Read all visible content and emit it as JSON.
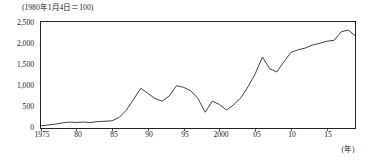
{
  "chart_data": {
    "type": "line",
    "title": "(1980年1月4日＝100)",
    "xlabel": "(年)",
    "ylabel": "",
    "xlim": [
      1975,
      2019
    ],
    "ylim": [
      0,
      2500
    ],
    "grid": false,
    "legend": "none",
    "y_ticks": [
      "0",
      "500",
      "1,000",
      "1,500",
      "2,000",
      "2,500"
    ],
    "y_tick_values": [
      0,
      500,
      1000,
      1500,
      2000,
      2500
    ],
    "x_ticks": [
      "1975",
      "80",
      "85",
      "90",
      "95",
      "2000",
      "05",
      "10",
      "15"
    ],
    "x_tick_values": [
      1975,
      1980,
      1985,
      1990,
      1995,
      2000,
      2005,
      2010,
      2015
    ],
    "series": [
      {
        "name": "指数",
        "x": [
          1975,
          1976,
          1977,
          1978,
          1979,
          1980,
          1981,
          1982,
          1983,
          1984,
          1985,
          1986,
          1987,
          1988,
          1989,
          1990,
          1991,
          1992,
          1993,
          1994,
          1995,
          1996,
          1997,
          1998,
          1999,
          2000,
          2001,
          2002,
          2003,
          2004,
          2005,
          2006,
          2007,
          2008,
          2009,
          2010,
          2011,
          2012,
          2013,
          2014,
          2015,
          2016,
          2017,
          2018,
          2019
        ],
        "values": [
          60,
          80,
          100,
          130,
          150,
          140,
          150,
          140,
          160,
          170,
          180,
          260,
          430,
          680,
          940,
          820,
          700,
          640,
          760,
          1000,
          960,
          880,
          700,
          380,
          640,
          560,
          430,
          560,
          720,
          980,
          1280,
          1670,
          1400,
          1320,
          1560,
          1780,
          1840,
          1880,
          1950,
          1990,
          2040,
          2060,
          2260,
          2300,
          2160
        ]
      }
    ]
  }
}
